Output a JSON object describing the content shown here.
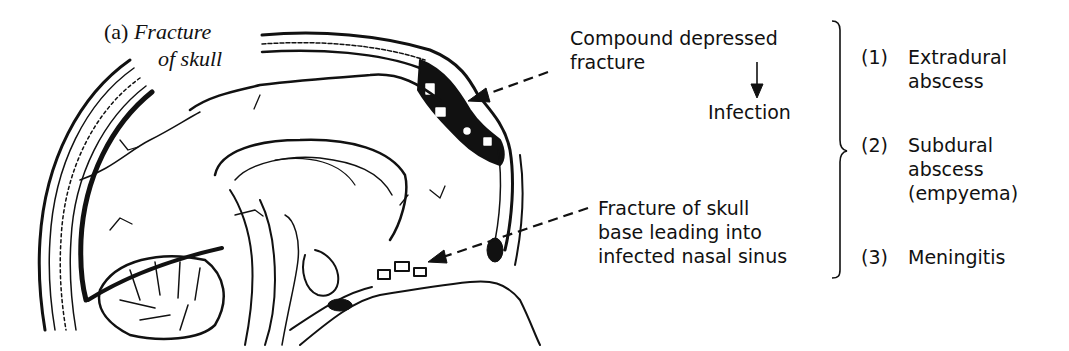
{
  "figure": {
    "panel_label": "(a)",
    "panel_title_line1": "Fracture",
    "panel_title_line2": "of skull"
  },
  "annotations": {
    "compound_fracture_line1": "Compound depressed",
    "compound_fracture_line2": "fracture",
    "infection": "Infection",
    "skull_base_line1": "Fracture of skull",
    "skull_base_line2": "base leading into",
    "skull_base_line3": "infected nasal sinus"
  },
  "outcomes": [
    {
      "number": "(1)",
      "line1": "Extradural",
      "line2": "abscess",
      "line3": ""
    },
    {
      "number": "(2)",
      "line1": "Subdural",
      "line2": "abscess",
      "line3": "(empyema)"
    },
    {
      "number": "(3)",
      "line1": "Meningitis",
      "line2": "",
      "line3": ""
    }
  ],
  "colors": {
    "ink": "#111111",
    "background": "#ffffff"
  }
}
